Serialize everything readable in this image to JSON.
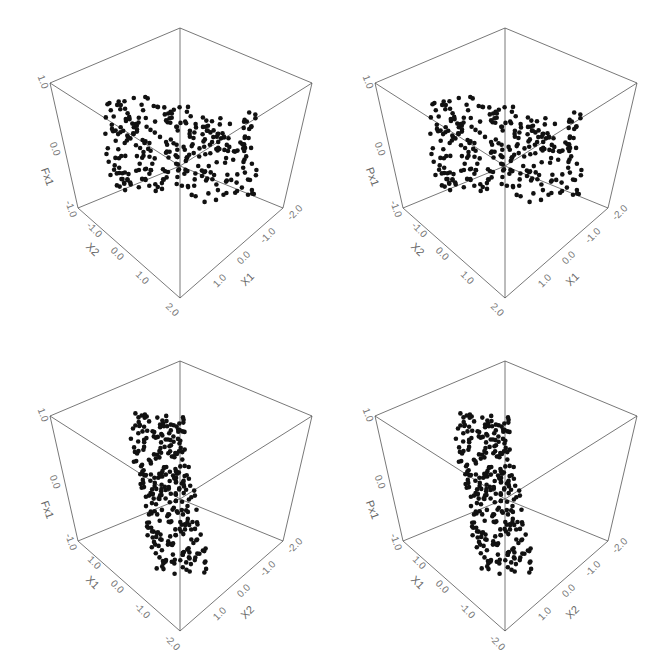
{
  "chart_data": [
    {
      "type": "scatter",
      "title": "",
      "panel": "top-left",
      "axes": {
        "vertical": {
          "label": "Fx1",
          "ticks": [
            "-1.0",
            "0.0",
            "1.0"
          ]
        },
        "left_floor": {
          "label": "X2",
          "ticks": [
            "-1.0",
            "0.0",
            "1.0",
            "2.0"
          ]
        },
        "right_floor": {
          "label": "X1",
          "ticks": [
            "1.0",
            "0.0",
            "-1.0",
            "-2.0"
          ]
        }
      },
      "description": "3D scatter of ~300 points forming a saddle / S-shaped surface, horizontally spread"
    },
    {
      "type": "scatter",
      "title": "",
      "panel": "top-right",
      "axes": {
        "vertical": {
          "label": "Px1",
          "ticks": [
            "-1.0",
            "0.0",
            "1.0"
          ]
        },
        "left_floor": {
          "label": "X2",
          "ticks": [
            "-1.0",
            "0.0",
            "1.0",
            "2.0"
          ]
        },
        "right_floor": {
          "label": "X1",
          "ticks": [
            "1.0",
            "0.0",
            "-1.0",
            "-2.0"
          ]
        }
      },
      "description": "3D scatter of ~300 points forming a saddle / S-shaped surface, horizontally spread"
    },
    {
      "type": "scatter",
      "title": "",
      "panel": "bottom-left",
      "axes": {
        "vertical": {
          "label": "Fx1",
          "ticks": [
            "-1.0",
            "0.0",
            "1.0"
          ]
        },
        "left_floor": {
          "label": "X1",
          "ticks": [
            "1.0",
            "0.0",
            "-1.0",
            "-2.0"
          ]
        },
        "right_floor": {
          "label": "X2",
          "ticks": [
            "1.0",
            "0.0",
            "-1.0",
            "-2.0"
          ]
        }
      },
      "description": "Same surface rotated; points form a tall narrow vertical band"
    },
    {
      "type": "scatter",
      "title": "",
      "panel": "bottom-right",
      "axes": {
        "vertical": {
          "label": "Px1",
          "ticks": [
            "-1.0",
            "0.0",
            "1.0"
          ]
        },
        "left_floor": {
          "label": "X1",
          "ticks": [
            "1.0",
            "0.0",
            "-1.0",
            "-2.0"
          ]
        },
        "right_floor": {
          "label": "X2",
          "ticks": [
            "1.0",
            "0.0",
            "-1.0",
            "-2.0"
          ]
        }
      },
      "description": "Same surface rotated; points form a tall narrow vertical band"
    }
  ],
  "panels": [
    {
      "v_label": "Fx1",
      "v_top": "1.0",
      "v_mid": "0.0",
      "v_bot": "-1.0",
      "l_label": "X2",
      "l_t1": "-1.0",
      "l_t2": "0.0",
      "l_t3": "1.0",
      "l_t4": "2.0",
      "r_label": "X1",
      "r_t1": "-2.0",
      "r_t2": "-1.0",
      "r_t3": "0.0",
      "r_t4": "1.0"
    },
    {
      "v_label": "Px1",
      "v_top": "1.0",
      "v_mid": "0.0",
      "v_bot": "-1.0",
      "l_label": "X2",
      "l_t1": "-1.0",
      "l_t2": "0.0",
      "l_t3": "1.0",
      "l_t4": "2.0",
      "r_label": "X1",
      "r_t1": "-2.0",
      "r_t2": "-1.0",
      "r_t3": "0.0",
      "r_t4": "1.0"
    },
    {
      "v_label": "Fx1",
      "v_top": "1.0",
      "v_mid": "0.0",
      "v_bot": "-1.0",
      "l_label": "X1",
      "l_t1": "1.0",
      "l_t2": "0.0",
      "l_t3": "-1.0",
      "l_t4": "-2.0",
      "r_label": "X2",
      "r_t1": "-2.0",
      "r_t2": "-1.0",
      "r_t3": "0.0",
      "r_t4": "1.0"
    },
    {
      "v_label": "Px1",
      "v_top": "1.0",
      "v_mid": "0.0",
      "v_bot": "-1.0",
      "l_label": "X1",
      "l_t1": "1.0",
      "l_t2": "0.0",
      "l_t3": "-1.0",
      "l_t4": "-2.0",
      "r_label": "X2",
      "r_t1": "-2.0",
      "r_t2": "-1.0",
      "r_t3": "0.0",
      "r_t4": "1.0"
    }
  ]
}
